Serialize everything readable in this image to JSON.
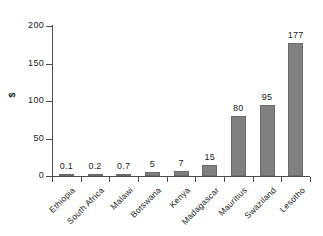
{
  "chart_data": {
    "type": "bar",
    "title": "",
    "xlabel": "",
    "ylabel": "$",
    "categories": [
      "Ethiopia",
      "South Africa",
      "Malawi",
      "Botswana",
      "Kenya",
      "Madagascar",
      "Mauritius",
      "Swaziland",
      "Lesotho"
    ],
    "values": [
      0.1,
      0.2,
      0.7,
      5,
      7,
      15,
      80,
      95,
      177
    ],
    "value_labels": [
      "0.1",
      "0.2",
      "0.7",
      "5",
      "7",
      "15",
      "80",
      "95",
      "177"
    ],
    "ylim": [
      0,
      200
    ],
    "yticks": [
      0,
      50,
      100,
      150,
      200
    ],
    "ytick_labels": [
      "0",
      "50",
      "100",
      "150",
      "200"
    ],
    "grid": false,
    "legend": null,
    "bar_color": "#808080",
    "axis_color": "#4d4d4d",
    "text_color": "#1a1a1a",
    "background": "#ffffff"
  }
}
